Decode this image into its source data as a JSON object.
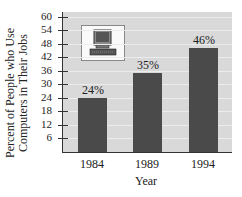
{
  "chart_data": {
    "type": "bar",
    "title": "",
    "categories": [
      "1984",
      "1989",
      "1994"
    ],
    "values": [
      24,
      35,
      46
    ],
    "value_labels": [
      "24%",
      "35%",
      "46%"
    ],
    "xlabel": "Year",
    "ylabel": "Percent of People who Use Computers in Their Jobs",
    "ylabel_lines": [
      "Percent of People who Use",
      "Computers in Their Jobs"
    ],
    "yticks": [
      6,
      12,
      18,
      24,
      30,
      36,
      42,
      48,
      54,
      60
    ],
    "ylim": [
      0,
      62
    ],
    "grid": true,
    "legend": null,
    "annotations": [
      "computer-icon"
    ],
    "colors": {
      "bar": "#4a4a4a",
      "plot_bg": "#d9d9d9",
      "grid": "#ececec",
      "axis": "#333333"
    }
  }
}
